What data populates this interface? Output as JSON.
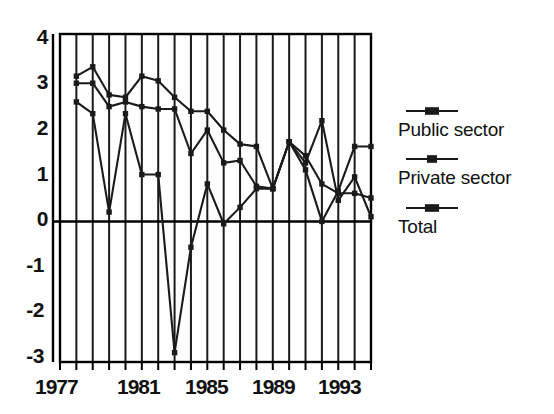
{
  "chart_data": {
    "type": "line",
    "title": "",
    "xlabel": "",
    "ylabel": "",
    "xlim": [
      1977,
      1996
    ],
    "ylim": [
      -3,
      4
    ],
    "grid": "vertical-yearly",
    "legend_position": "right",
    "y_ticks": [
      "4",
      "3",
      "2",
      "1",
      "0",
      "-1",
      "-2",
      "-3"
    ],
    "y_tick_values": [
      4,
      3,
      2,
      1,
      0,
      -1,
      -2,
      -3
    ],
    "x_ticks": [
      "1977",
      "1981",
      "1985",
      "1989",
      "1993"
    ],
    "x_tick_values": [
      1977,
      1981,
      1985,
      1989,
      1993
    ],
    "x": [
      1978,
      1979,
      1980,
      1981,
      1982,
      1983,
      1984,
      1985,
      1986,
      1987,
      1988,
      1989,
      1990,
      1991,
      1992,
      1993,
      1994,
      1995
    ],
    "series": [
      {
        "name": "Public sector",
        "marker": "square",
        "values": [
          3.1,
          3.3,
          2.7,
          2.65,
          3.1,
          3.0,
          2.65,
          2.35,
          2.35,
          1.95,
          1.65,
          1.6,
          0.7,
          1.7,
          1.25,
          2.15,
          0.45,
          0.95
        ]
      },
      {
        "name": "Private sector",
        "marker": "square",
        "values": [
          2.95,
          2.95,
          2.45,
          2.55,
          2.45,
          2.4,
          2.4,
          1.45,
          1.95,
          1.25,
          1.3,
          0.75,
          0.7,
          1.7,
          1.4,
          0.8,
          0.6,
          0.6
        ]
      },
      {
        "name": "Total",
        "marker": "square",
        "values": [
          2.55,
          2.3,
          0.2,
          2.3,
          1.0,
          1.0,
          -2.8,
          -0.55,
          0.8,
          -0.05,
          0.3,
          0.7,
          0.7,
          1.7,
          1.1,
          0.0,
          0.65,
          1.6
        ]
      }
    ],
    "last_points": {
      "public_sector_1996": 0.1,
      "private_sector_1996": 0.5,
      "total_1996": 1.6
    },
    "colors": {
      "line": "#1a1a1a",
      "grid": "#1a1a1a",
      "axis": "#000000",
      "background": "#ffffff"
    }
  },
  "legend": {
    "items": [
      {
        "label": "Public sector"
      },
      {
        "label": "Private sector"
      },
      {
        "label": "Total"
      }
    ]
  }
}
